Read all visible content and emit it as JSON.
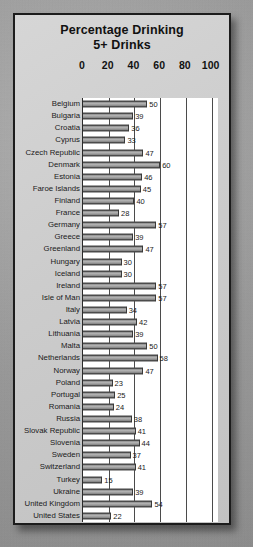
{
  "chart_data": {
    "type": "bar",
    "orientation": "horizontal",
    "title": "Percentage Drinking 5+ Drinks",
    "title_lines": [
      "Percentage Drinking",
      "5+ Drinks"
    ],
    "xlabel": "",
    "ylabel": "",
    "xlim": [
      0,
      105
    ],
    "xticks": [
      0,
      20,
      40,
      60,
      80,
      100
    ],
    "xtick_labels": [
      "0",
      "20",
      "40",
      "60",
      "80",
      "100"
    ],
    "grid": true,
    "legend": null,
    "bar_color": "#8e8e8e",
    "bar_edge_color": "#4a4a4a",
    "plot_background": "#ffffff",
    "panel_background": "#cccccc",
    "frame_color": "#1c1c1c",
    "categories": [
      "Belgium",
      "Bulgaria",
      "Croatia",
      "Cyprus",
      "Czech Republic",
      "Denmark",
      "Estonia",
      "Faroe Islands",
      "Finland",
      "France",
      "Germany",
      "Greece",
      "Greenland",
      "Hungary",
      "Iceland",
      "Ireland",
      "Isle of Man",
      "Italy",
      "Latvia",
      "Lithuania",
      "Malta",
      "Netherlands",
      "Norway",
      "Poland",
      "Portugal",
      "Romania",
      "Russia",
      "Slovak Republic",
      "Slovenia",
      "Sweden",
      "Switzerland",
      "Turkey",
      "Ukraine",
      "United Kingdom",
      "United States"
    ],
    "values": [
      50,
      39,
      36,
      33,
      47,
      60,
      46,
      45,
      40,
      28,
      57,
      39,
      47,
      30,
      30,
      57,
      57,
      34,
      42,
      39,
      50,
      58,
      47,
      23,
      25,
      24,
      38,
      41,
      44,
      37,
      41,
      15,
      39,
      54,
      22
    ]
  }
}
